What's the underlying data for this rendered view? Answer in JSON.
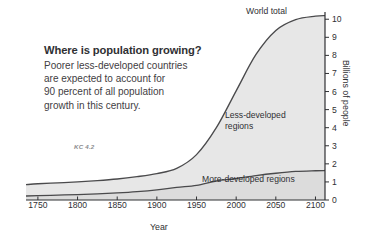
{
  "callout": {
    "title": "Where is population growing?",
    "body_lines": [
      "Poorer less-developed countries",
      "are expected to account for",
      "90 percent of all population",
      "growth in this century."
    ],
    "figure_tag": "KC 4.2"
  },
  "annotations": {
    "world_total": "World total",
    "less_developed_line1": "Less-developed",
    "less_developed_line2": "regions",
    "more_developed": "More-developed regions"
  },
  "colors": {
    "area_fill": "#e7e7e7",
    "curve_stroke": "#4a4a4c",
    "axis": "#2f3033",
    "text": "#3a3a3c",
    "tag": "#8a8b8e"
  },
  "chart_data": {
    "type": "area",
    "stacked": true,
    "title": "",
    "xlabel": "Year",
    "ylabel": "Billions of people",
    "xlim": [
      1735,
      2112
    ],
    "ylim": [
      0,
      10.4
    ],
    "grid": false,
    "legend": "in-plot labels",
    "xticks": [
      1750,
      1800,
      1850,
      1900,
      1950,
      2000,
      2050,
      2100
    ],
    "yticks": [
      0,
      1,
      2,
      3,
      4,
      5,
      6,
      7,
      8,
      9,
      10
    ],
    "x": [
      1735,
      1750,
      1775,
      1800,
      1825,
      1850,
      1875,
      1900,
      1925,
      1950,
      1975,
      2000,
      2025,
      2050,
      2075,
      2100,
      2112
    ],
    "series": [
      {
        "name": "More-developed regions",
        "values": [
          0.22,
          0.24,
          0.27,
          0.3,
          0.34,
          0.39,
          0.46,
          0.56,
          0.7,
          0.81,
          1.05,
          1.19,
          1.35,
          1.48,
          1.58,
          1.62,
          1.63
        ]
      },
      {
        "name": "Less-developed regions",
        "values": [
          0.63,
          0.66,
          0.68,
          0.7,
          0.73,
          0.77,
          0.83,
          0.9,
          1.05,
          1.7,
          2.95,
          4.85,
          6.7,
          7.9,
          8.4,
          8.55,
          8.57
        ]
      }
    ],
    "world_total": {
      "name": "World total",
      "values": [
        0.85,
        0.9,
        0.95,
        1.0,
        1.07,
        1.16,
        1.29,
        1.46,
        1.75,
        2.51,
        4.0,
        6.04,
        8.05,
        9.38,
        9.98,
        10.17,
        10.2
      ]
    }
  }
}
